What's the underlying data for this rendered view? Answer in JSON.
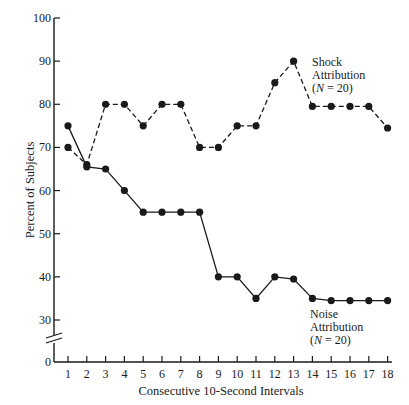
{
  "chart_data": {
    "type": "line",
    "title": "",
    "xlabel": "Consecutive 10-Second Intervals",
    "ylabel": "Percent of Subjects",
    "x": [
      1,
      2,
      3,
      4,
      5,
      6,
      7,
      8,
      9,
      10,
      11,
      12,
      13,
      14,
      15,
      16,
      17,
      18
    ],
    "x_tick_labels": [
      "1",
      "2",
      "3",
      "4",
      "5",
      "6",
      "7",
      "8",
      "9",
      "10",
      "11",
      "12",
      "13",
      "14",
      "15",
      "16",
      "17",
      "18"
    ],
    "y_tick_labels": [
      "0",
      "30",
      "40",
      "50",
      "60",
      "70",
      "80",
      "90",
      "100"
    ],
    "y_ticks": [
      0,
      30,
      40,
      50,
      60,
      70,
      80,
      90,
      100
    ],
    "ylim": [
      0,
      100
    ],
    "y_axis_break": "between 0 and 30",
    "grid": false,
    "legend_position": "inline annotations",
    "series": [
      {
        "name": "Shock Attribution (N = 20)",
        "line_style": "dashed",
        "marker": "filled-circle",
        "values": [
          70,
          66,
          80,
          80,
          75,
          80,
          80,
          70,
          70,
          75,
          75,
          85,
          90,
          79.5,
          79.5,
          79.5,
          79.5,
          74.5
        ]
      },
      {
        "name": "Noise Attribution (N = 20)",
        "line_style": "solid",
        "marker": "filled-circle",
        "values": [
          75,
          65.5,
          65,
          60,
          55,
          55,
          55,
          55,
          40,
          40,
          35,
          40,
          39.5,
          35,
          34.5,
          34.5,
          34.5,
          34.5
        ]
      }
    ],
    "annotations": [
      {
        "series": "shock",
        "lines": [
          "Shock",
          "Attribution",
          "(N = 20)"
        ]
      },
      {
        "series": "noise",
        "lines": [
          "Noise",
          "Attribution",
          "(N = 20)"
        ]
      }
    ]
  },
  "labels": {
    "xlabel": "Consecutive 10-Second Intervals",
    "ylabel": "Percent of Subjects",
    "shock_line1": "Shock",
    "shock_line2": "Attribution",
    "shock_line3_pre": "(",
    "shock_line3_n": "N",
    "shock_line3_post": " = 20)",
    "noise_line1": "Noise",
    "noise_line2": "Attribution",
    "noise_line3_pre": "(",
    "noise_line3_n": "N",
    "noise_line3_post": " = 20)"
  },
  "colors": {
    "ink": "#1a1a1a",
    "background": "#ffffff"
  }
}
